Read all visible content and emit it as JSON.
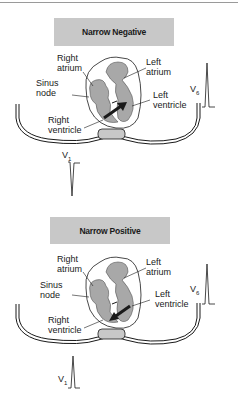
{
  "panels": [
    {
      "title": "Narrow Negative",
      "labels": {
        "right_atrium": "Right\natrium",
        "left_atrium": "Left\natrium",
        "sinus_node": "Sinus\nnode",
        "left_ventricle": "Left\nventricle",
        "right_ventricle": "Right\nventricle"
      },
      "leads": {
        "v6": {
          "name": "V",
          "sub": "6",
          "deflection": "positive"
        },
        "v1": {
          "name": "V",
          "sub": "1",
          "deflection": "negative"
        }
      }
    },
    {
      "title": "Narrow Positive",
      "labels": {
        "right_atrium": "Right\natrium",
        "left_atrium": "Left\natrium",
        "sinus_node": "Sinus\nnode",
        "left_ventricle": "Left\nventricle",
        "right_ventricle": "Right\nventricle"
      },
      "leads": {
        "v6": {
          "name": "V",
          "sub": "6",
          "deflection": "positive"
        },
        "v1": {
          "name": "V",
          "sub": "1",
          "deflection": "positive"
        }
      }
    }
  ],
  "colors": {
    "title_box": "#c8c8c8",
    "heart_fill": "#a8a8a8",
    "line": "#1a1a1a"
  }
}
